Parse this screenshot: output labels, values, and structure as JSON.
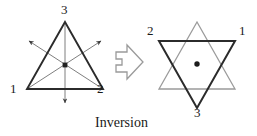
{
  "caption": {
    "text": "Inversion"
  },
  "colors": {
    "stroke_dark": "#2b2b2b",
    "stroke_light": "#8a8a8a",
    "arrow_outline": "#9a9a9a",
    "text": "#1a1a1a",
    "background": "#ffffff"
  },
  "left_figure": {
    "name": "upright-triangle-with-inversion-axes",
    "shape": "triangle",
    "vertex_labels": [
      {
        "id": "top",
        "text": "3",
        "x": 61,
        "y": 5
      },
      {
        "id": "bottom-left",
        "text": "1",
        "x": 10,
        "y": 86
      },
      {
        "id": "bottom-right",
        "text": "2",
        "x": 96,
        "y": 86
      }
    ],
    "center_marker": "filled-square-dot",
    "axis_count": 3,
    "axis_arrow_directions": [
      "down",
      "upper-right",
      "upper-left"
    ]
  },
  "transform_arrow": {
    "name": "block-arrow-right",
    "direction": "right",
    "style": "hollow-outline"
  },
  "right_figure": {
    "name": "hexagram-star-after-inversion",
    "shape": "hexagram",
    "vertex_labels": [
      {
        "id": "top-left",
        "text": "2",
        "x": 148,
        "y": 27
      },
      {
        "id": "top-right",
        "text": "1",
        "x": 238,
        "y": 27
      },
      {
        "id": "bottom",
        "text": "3",
        "x": 197,
        "y": 104
      }
    ],
    "center_marker": "filled-round-dot",
    "layers": [
      {
        "id": "original-triangle",
        "orientation": "up",
        "tone": "light"
      },
      {
        "id": "inverted-triangle",
        "orientation": "down",
        "tone": "dark"
      }
    ]
  }
}
